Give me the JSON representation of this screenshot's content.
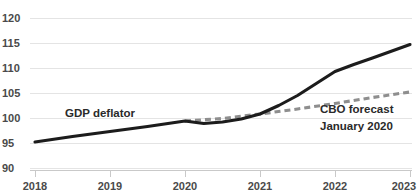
{
  "chart_data": {
    "type": "line",
    "title": "",
    "xlabel": "",
    "ylabel": "",
    "xlim": [
      2018,
      2023
    ],
    "ylim": [
      90,
      120
    ],
    "yticks": [
      "90",
      "95",
      "100",
      "105",
      "110",
      "115",
      "120"
    ],
    "xticks": [
      "2018",
      "2019",
      "2020",
      "2021",
      "2022",
      "2023"
    ],
    "grid": true,
    "legend_position": "inline-annotations",
    "series": [
      {
        "name": "GDP deflator",
        "style": "solid",
        "color": "#1c1c1c",
        "x": [
          2018.0,
          2018.5,
          2019.0,
          2019.5,
          2020.0,
          2020.25,
          2020.5,
          2020.75,
          2021.0,
          2021.25,
          2021.5,
          2021.75,
          2022.0,
          2022.25,
          2022.5,
          2023.0
        ],
        "values": [
          95.3,
          96.4,
          97.4,
          98.4,
          99.5,
          99.0,
          99.3,
          99.9,
          100.9,
          102.6,
          104.6,
          107.0,
          109.4,
          110.8,
          112.1,
          114.8
        ]
      },
      {
        "name": "CBO forecast January 2020",
        "style": "dashed",
        "color": "#8e8e8e",
        "x": [
          2020.0,
          2020.5,
          2021.0,
          2021.5,
          2022.0,
          2022.5,
          2023.0
        ],
        "values": [
          99.5,
          100.0,
          100.9,
          101.9,
          103.0,
          104.2,
          105.3
        ]
      }
    ],
    "annotations": [
      {
        "name": "gdp-deflator-label",
        "text": "GDP deflator",
        "x_px": 65,
        "y_px": 117
      },
      {
        "name": "cbo-forecast-label-line1",
        "text": "CBO forecast",
        "x_px": 320,
        "y_px": 113
      },
      {
        "name": "cbo-forecast-label-line2",
        "text": "January 2020",
        "x_px": 320,
        "y_px": 130
      }
    ]
  },
  "axis": {
    "y": {
      "t120": "120",
      "t115": "115",
      "t110": "110",
      "t105": "105",
      "t100": "100",
      "t95": "95",
      "t90": "90"
    },
    "x": {
      "t2018": "2018",
      "t2019": "2019",
      "t2020": "2020",
      "t2021": "2021",
      "t2022": "2022",
      "t2023": "2023"
    }
  },
  "labels": {
    "actual_series": "GDP deflator",
    "forecast_series_line1": "CBO forecast",
    "forecast_series_line2": "January 2020"
  },
  "title": {
    "text": ""
  },
  "colors": {
    "actual": "#1c1c1c",
    "forecast": "#8e8e8e",
    "grid": "#e4e4e4",
    "axis": "#c9c9c9",
    "text": "#4a4a4a",
    "background": "#ffffff"
  }
}
